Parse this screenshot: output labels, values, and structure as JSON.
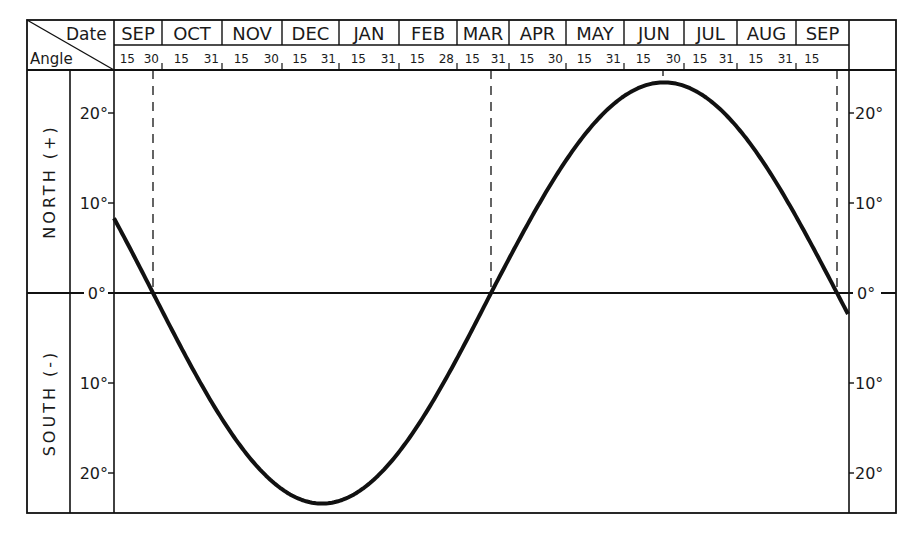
{
  "chart_data": {
    "type": "line",
    "title": "",
    "header": {
      "corner_top": "Date",
      "corner_bottom": "Angle"
    },
    "xlabel": "Date",
    "ylabel": "Angle",
    "side_labels": {
      "north": "NORTH (+)",
      "south": "SOUTH (-)"
    },
    "months": [
      "SEP",
      "OCT",
      "NOV",
      "DEC",
      "JAN",
      "FEB",
      "MAR",
      "APR",
      "MAY",
      "JUN",
      "JUL",
      "AUG",
      "SEP"
    ],
    "day_ticks": [
      [
        "15",
        "30"
      ],
      [
        "15",
        "31"
      ],
      [
        "15",
        "30"
      ],
      [
        "15",
        "31"
      ],
      [
        "15",
        "31"
      ],
      [
        "15",
        "28"
      ],
      [
        "15",
        "31"
      ],
      [
        "15",
        "30"
      ],
      [
        "15",
        "31"
      ],
      [
        "15",
        "30"
      ],
      [
        "15",
        "31"
      ],
      [
        "15",
        "31"
      ],
      [
        "15"
      ]
    ],
    "y_ticks_left": [
      "20°",
      "10°",
      "0°",
      "10°",
      "20°"
    ],
    "y_ticks_right": [
      "20°",
      "10°",
      "0°",
      "10°",
      "20°"
    ],
    "ylim": [
      -25,
      25
    ],
    "grid": false,
    "series": [
      {
        "name": "Solar declination",
        "x": [
          "Sep 1",
          "Sep 23",
          "Oct 15",
          "Nov 1",
          "Nov 15",
          "Dec 1",
          "Dec 22",
          "Jan 15",
          "Feb 1",
          "Feb 15",
          "Mar 1",
          "Mar 21",
          "Apr 15",
          "May 1",
          "May 15",
          "Jun 1",
          "Jun 21",
          "Jul 15",
          "Aug 1",
          "Aug 15",
          "Sep 1",
          "Sep 23",
          "Sep 30"
        ],
        "values": [
          8.2,
          0,
          -8.5,
          -14.3,
          -18.4,
          -21.7,
          -23.4,
          -21.3,
          -17.3,
          -13.0,
          -7.8,
          0,
          9.5,
          14.8,
          18.7,
          21.9,
          23.4,
          21.6,
          18.2,
          14.0,
          8.5,
          0,
          -3
        ]
      }
    ],
    "markers": [
      {
        "label": "Autumnal equinox",
        "date": "Sep 23",
        "style": "dashed"
      },
      {
        "label": "Vernal equinox",
        "date": "Mar 21",
        "style": "dashed"
      },
      {
        "label": "Summer solstice",
        "date": "Jun 21",
        "style": "dashed tick"
      },
      {
        "label": "Autumnal equinox",
        "date": "Sep 23",
        "style": "dashed"
      }
    ]
  },
  "colors": {
    "ink": "#111111",
    "background": "#ffffff"
  }
}
